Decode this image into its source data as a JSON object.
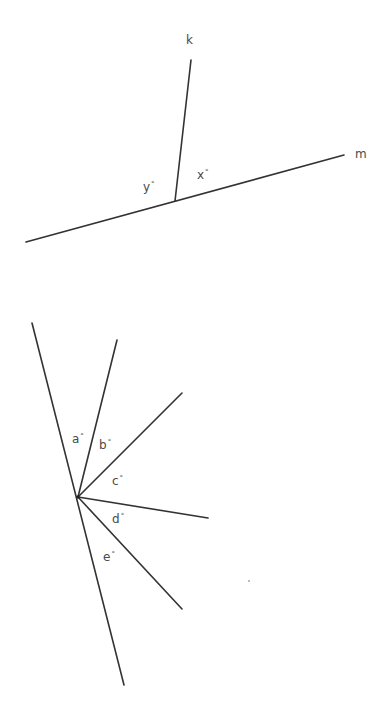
{
  "figure_top": {
    "lines": {
      "k": {
        "label": "k",
        "x1": 191,
        "y1": 60,
        "x2": 175,
        "y2": 201,
        "label_x": 186,
        "label_y": 44
      },
      "m": {
        "label": "m",
        "x1": 26,
        "y1": 242,
        "x2": 344,
        "y2": 155,
        "label_x": 355,
        "label_y": 158
      }
    },
    "angles": {
      "y": {
        "label": "y",
        "degree": "°",
        "x": 143,
        "y": 191
      },
      "x": {
        "label": "x",
        "degree": "°",
        "x": 197,
        "y": 179
      }
    }
  },
  "figure_bottom": {
    "vertex": {
      "x": 78,
      "y": 497
    },
    "main_line": {
      "x1": 32,
      "y1": 323,
      "x2": 124,
      "y2": 685
    },
    "rays": [
      {
        "name": "ray-1",
        "x2": 117,
        "y2": 340
      },
      {
        "name": "ray-2",
        "x2": 182,
        "y2": 393
      },
      {
        "name": "ray-3",
        "x2": 208,
        "y2": 518
      },
      {
        "name": "ray-4",
        "x2": 182,
        "y2": 609
      }
    ],
    "angles": {
      "a": {
        "label": "a",
        "degree": "°",
        "x": 72,
        "y": 443
      },
      "b": {
        "label": "b",
        "degree": "°",
        "x": 99,
        "y": 449
      },
      "c": {
        "label": "c",
        "degree": "°",
        "x": 112,
        "y": 485
      },
      "d": {
        "label": "d",
        "degree": "°",
        "x": 112,
        "y": 523
      },
      "e": {
        "label": "e",
        "degree": "°",
        "x": 103,
        "y": 561
      }
    }
  },
  "colors": {
    "line": "#333333",
    "label": "#4a4a4a"
  }
}
